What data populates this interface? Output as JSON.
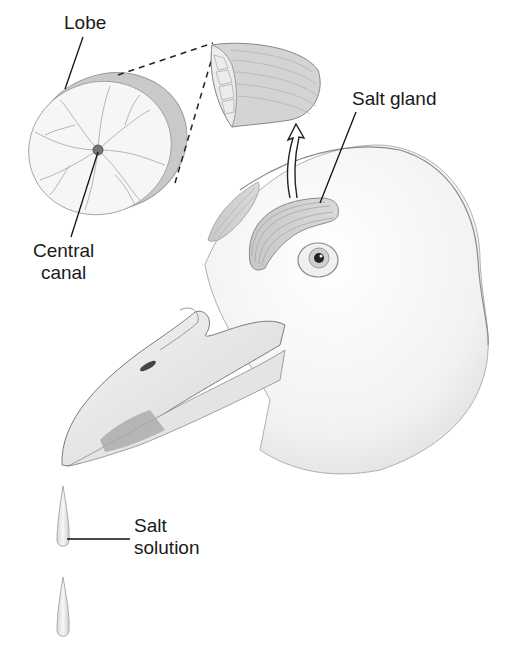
{
  "figure": {
    "labels": {
      "lobe": "Lobe",
      "salt_gland": "Salt gland",
      "central_canal_line1": "Central",
      "central_canal_line2": "canal",
      "salt_solution_line1": "Salt",
      "salt_solution_line2": "solution"
    },
    "colors": {
      "background": "#ffffff",
      "line": "#1a1a1a",
      "tissue": "#d9d9d9",
      "tissue_dark": "#a8a8a8",
      "head_shade": "#e6e6e6"
    }
  }
}
